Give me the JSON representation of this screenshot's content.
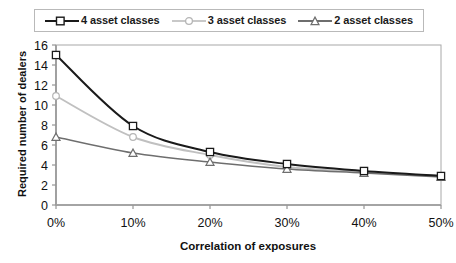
{
  "chart_data": {
    "type": "line",
    "title": "",
    "xlabel": "Correlation of exposures",
    "ylabel": "Required number of dealers",
    "categories": [
      "0%",
      "10%",
      "20%",
      "30%",
      "40%",
      "50%"
    ],
    "x": [
      0,
      10,
      20,
      30,
      40,
      50
    ],
    "xlim": [
      0,
      50
    ],
    "ylim": [
      0,
      16
    ],
    "ytick_labels": [
      "0",
      "2",
      "4",
      "6",
      "8",
      "10",
      "12",
      "14",
      "16"
    ],
    "yticks": [
      0,
      2,
      4,
      6,
      8,
      10,
      12,
      14,
      16
    ],
    "xtick_labels": [
      "0%",
      "10%",
      "20%",
      "30%",
      "40%",
      "50%"
    ],
    "grid": false,
    "legend_position": "top",
    "series": [
      {
        "name": "4 asset classes",
        "marker": "square",
        "color": "#1a1a1a",
        "values": [
          15.0,
          7.9,
          5.3,
          4.1,
          3.4,
          2.9
        ]
      },
      {
        "name": "3 asset classes",
        "marker": "circle",
        "color": "#c0c0c0",
        "values": [
          10.9,
          6.8,
          5.0,
          3.8,
          3.3,
          2.9
        ]
      },
      {
        "name": "2 asset classes",
        "marker": "triangle",
        "color": "#6e6e6e",
        "values": [
          6.8,
          5.2,
          4.3,
          3.6,
          3.2,
          2.8
        ]
      }
    ]
  },
  "legend": {
    "items": [
      {
        "label": "4 asset classes"
      },
      {
        "label": "3 asset classes"
      },
      {
        "label": "2 asset classes"
      }
    ]
  },
  "axes": {
    "x_title": "Correlation of exposures",
    "y_title": "Required number of dealers"
  },
  "colors": {
    "series_4": "#1a1a1a",
    "series_3": "#c0c0c0",
    "series_2": "#6e6e6e",
    "axis": "#808080",
    "plot_border": "#a8a8a8",
    "background": "#ffffff"
  }
}
